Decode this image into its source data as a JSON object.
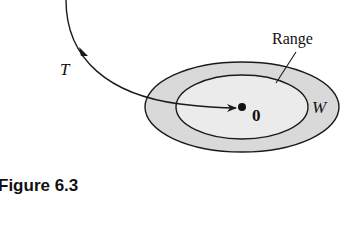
{
  "figure": {
    "caption": "Figure 6.3",
    "labels": {
      "transformation": "T",
      "range": "Range",
      "codomain": "W",
      "zero_vector": "0"
    },
    "colors": {
      "outer_fill": "#d9d9d9",
      "inner_fill": "#ebebeb",
      "stroke": "#1a1a1a"
    }
  }
}
